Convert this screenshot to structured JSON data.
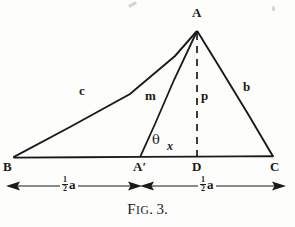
{
  "figure": {
    "caption_prefix": "F",
    "caption_prefix_small": "IG",
    "caption_period": ".",
    "caption_number": "3.",
    "caption_full": "FIG. 3.",
    "background_color": "#fdfdfc",
    "ink_color": "#1a1a1a"
  },
  "vertices": {
    "apex": {
      "label": "A",
      "x": 197,
      "y": 30
    },
    "left_base": {
      "label": "B",
      "x": 14,
      "y": 157
    },
    "right_base": {
      "label": "C",
      "x": 273,
      "y": 157
    },
    "median_foot": {
      "label": "A'",
      "x": 140,
      "y": 157
    },
    "altitude_foot": {
      "label": "D",
      "x": 197,
      "y": 157
    }
  },
  "segments": [
    {
      "name": "side-c",
      "label": "c",
      "from": "B",
      "to": "A",
      "style": "solid"
    },
    {
      "name": "side-b",
      "label": "b",
      "from": "A",
      "to": "C",
      "style": "solid"
    },
    {
      "name": "base-a",
      "label": "",
      "from": "B",
      "to": "C",
      "style": "solid"
    },
    {
      "name": "median-m",
      "label": "m",
      "from": "A'",
      "to": "A",
      "style": "solid"
    },
    {
      "name": "altitude-p",
      "label": "p",
      "from": "D",
      "to": "A",
      "style": "dashed"
    }
  ],
  "labels": {
    "c": "c",
    "b": "b",
    "m": "m",
    "p": "p",
    "theta": "θ",
    "x": "x",
    "A": "A",
    "B": "B",
    "C": "C",
    "A_prime": "A′",
    "D": "D"
  },
  "dimensions": [
    {
      "name": "dimension-left-half-a",
      "numerator": "1",
      "denominator": "2",
      "unit": "a",
      "text": "½a",
      "from_label": "B",
      "to_label": "A'",
      "arrow_start": 10,
      "arrow_end": 142,
      "y": 186
    },
    {
      "name": "dimension-right-half-a",
      "numerator": "1",
      "denominator": "2",
      "unit": "a",
      "text": "½a",
      "from_label": "A'",
      "to_label": "C",
      "arrow_start": 140,
      "arrow_end": 284,
      "y": 186
    }
  ]
}
